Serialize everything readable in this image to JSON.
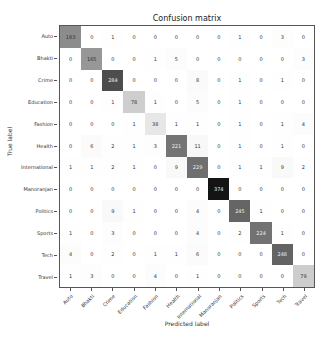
{
  "chart_data": {
    "type": "heatmap",
    "title": "Confusion matrix",
    "xlabel": "Predicted label",
    "ylabel": "True label",
    "colormap": "greys",
    "categories": [
      "Auto",
      "Bhakti",
      "Crime",
      "Education",
      "Fashion",
      "Health",
      "International",
      "Manoranjan",
      "Politics",
      "Sports",
      "Tech",
      "Travel"
    ],
    "matrix": [
      [
        183,
        0,
        1,
        0,
        0,
        0,
        0,
        0,
        1,
        0,
        3,
        0
      ],
      [
        0,
        165,
        0,
        0,
        1,
        5,
        0,
        0,
        0,
        0,
        0,
        3
      ],
      [
        0,
        0,
        284,
        0,
        0,
        0,
        8,
        0,
        1,
        0,
        1,
        0
      ],
      [
        0,
        0,
        1,
        78,
        1,
        0,
        5,
        0,
        1,
        0,
        0,
        0
      ],
      [
        0,
        0,
        0,
        1,
        38,
        1,
        1,
        0,
        1,
        0,
        1,
        4
      ],
      [
        0,
        6,
        2,
        1,
        3,
        221,
        11,
        0,
        1,
        0,
        1,
        0
      ],
      [
        1,
        1,
        2,
        1,
        0,
        9,
        229,
        0,
        1,
        1,
        9,
        2
      ],
      [
        0,
        0,
        0,
        0,
        0,
        0,
        0,
        374,
        0,
        0,
        0,
        0
      ],
      [
        0,
        0,
        9,
        1,
        0,
        0,
        4,
        0,
        245,
        1,
        0,
        0
      ],
      [
        1,
        0,
        3,
        0,
        0,
        0,
        4,
        0,
        2,
        224,
        1,
        0
      ],
      [
        4,
        0,
        2,
        0,
        1,
        1,
        6,
        0,
        0,
        0,
        248,
        0
      ],
      [
        1,
        3,
        0,
        0,
        4,
        0,
        1,
        0,
        0,
        0,
        0,
        79
      ]
    ],
    "vmin": 0,
    "vmax": 374
  }
}
